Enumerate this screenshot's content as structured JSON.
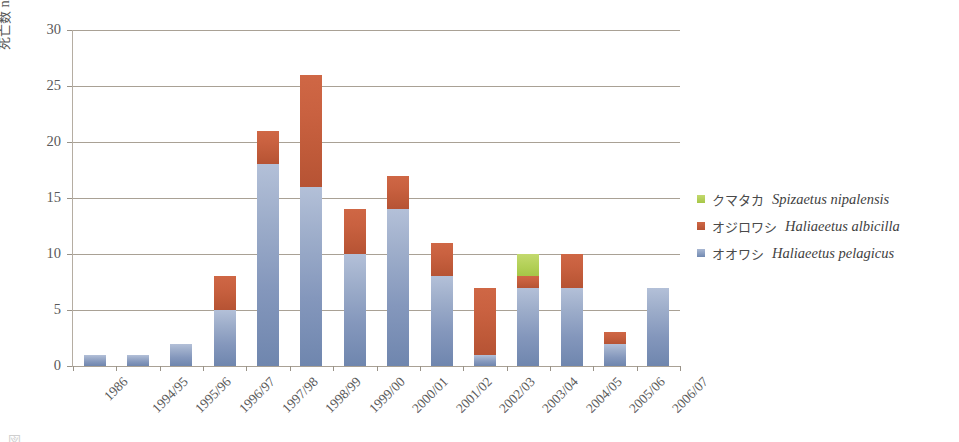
{
  "chart_data": {
    "type": "bar",
    "stacked": true,
    "title": "",
    "xlabel": "",
    "ylabel": "死亡数  number of deaths",
    "ylabel_jp": "死亡数",
    "ylabel_en": "number of deaths",
    "ylim": [
      0,
      30
    ],
    "ytick_step": 5,
    "yticks": [
      0,
      5,
      10,
      15,
      20,
      25,
      30
    ],
    "grid": true,
    "legend_position": "right",
    "categories": [
      "1986",
      "1994/95",
      "1995/96",
      "1996/97",
      "1997/98",
      "1998/99",
      "1999/00",
      "2000/01",
      "2001/02",
      "2002/03",
      "2003/04",
      "2004/05",
      "2005/06",
      "2006/07"
    ],
    "series": [
      {
        "name": "オオワシ  Haliaeetus pelagicus",
        "name_jp": "オオワシ",
        "name_sci": "Haliaeetus pelagicus",
        "color": "#8497bc",
        "values": [
          1,
          1,
          2,
          5,
          18,
          16,
          10,
          14,
          8,
          1,
          7,
          7,
          2,
          7
        ]
      },
      {
        "name": "オジロワシ  Haliaeetus albicilla",
        "name_jp": "オジロワシ",
        "name_sci": "Haliaeetus albicilla",
        "color": "#c45c3b",
        "values": [
          0,
          0,
          0,
          3,
          3,
          10,
          4,
          3,
          3,
          6,
          1,
          3,
          1,
          0
        ]
      },
      {
        "name": "クマタカ  Spizaetus nipalensis",
        "name_jp": "クマタカ",
        "name_sci": "Spizaetus nipalensis",
        "color": "#b4d159",
        "values": [
          0,
          0,
          0,
          0,
          0,
          0,
          0,
          0,
          0,
          0,
          2,
          0,
          0,
          0
        ]
      }
    ],
    "totals": [
      1,
      1,
      2,
      8,
      21,
      26,
      14,
      17,
      11,
      7,
      10,
      10,
      3,
      7
    ]
  },
  "legend": {
    "items": [
      {
        "jp": "クマタカ",
        "sci": "Spizaetus nipalensis",
        "swatch": "green"
      },
      {
        "jp": "オジロワシ",
        "sci": "Haliaeetus albicilla",
        "swatch": "red"
      },
      {
        "jp": "オオワシ",
        "sci": "Haliaeetus pelagicus",
        "swatch": "blue"
      }
    ]
  },
  "caption": {
    "sliver": "図"
  }
}
